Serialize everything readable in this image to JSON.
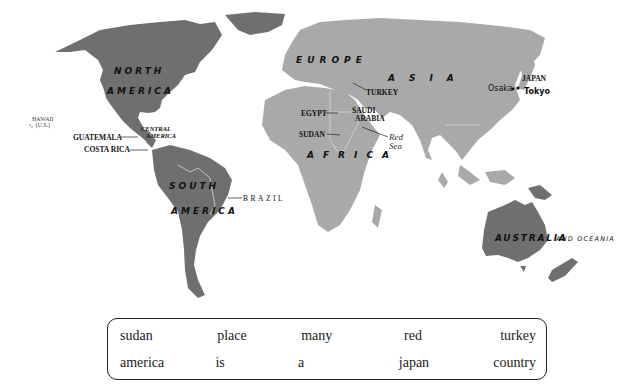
{
  "map": {
    "colors": {
      "americas_australia": "#6f6f6f",
      "eurasia_africa": "#a9a9a9",
      "ocean": "#ffffff",
      "border_line": "#d8d8d8"
    },
    "continent_labels": {
      "north_america_1": "NORTH",
      "north_america_2": "AMERICA",
      "south_america_1": "SOUTH",
      "south_america_2": "AMERICA",
      "europe": "EUROPE",
      "asia": "ASIA",
      "africa": "AFRICA",
      "australia": "AUSTRALIA",
      "oceania_suffix": "AND OCEANIA",
      "central_america_1": "CENTRAL",
      "central_america_2": "AMERICA"
    },
    "country_labels": {
      "hawaii": "HAWAII",
      "hawaii_sub": "(U.S.)",
      "guatemala": "GUATEMALA",
      "costa_rica": "COSTA RICA",
      "brazil": "BRAZIL",
      "turkey": "TURKEY",
      "egypt": "EGYPT",
      "saudi_arabia_1": "SAUDI",
      "saudi_arabia_2": "ARABIA",
      "sudan": "SUDAN",
      "japan": "JAPAN"
    },
    "other_labels": {
      "red_sea_1": "Red",
      "red_sea_2": "Sea",
      "osaka": "Osaka",
      "tokyo": "Tokyo"
    }
  },
  "word_bank": {
    "rows": [
      [
        "sudan",
        "place",
        "many",
        "red",
        "turkey"
      ],
      [
        "america",
        "is",
        "a",
        "japan",
        "country"
      ]
    ]
  }
}
